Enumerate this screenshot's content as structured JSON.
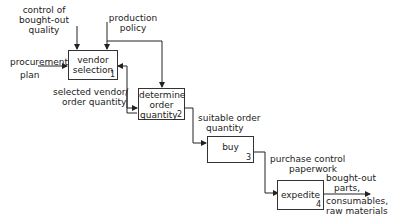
{
  "boxes": [
    {
      "id": 1,
      "label_lines": [
        "vendor",
        "selection"
      ],
      "number": "1"
    },
    {
      "id": 2,
      "label_lines": [
        "determine",
        "order",
        "quantity"
      ],
      "number": "2"
    },
    {
      "id": 3,
      "label_lines": [
        "buy"
      ],
      "number": "3"
    },
    {
      "id": 4,
      "label_lines": [
        "expedite"
      ],
      "number": "4"
    }
  ],
  "labels": {
    "control_quality": [
      "control of",
      "bought-out",
      "quality"
    ],
    "production_policy": [
      "production",
      "policy"
    ],
    "procurement_plan": [
      "procurement",
      "plan"
    ],
    "selected_vendor": [
      "selected vendor/",
      "order quantity"
    ],
    "suitable_order": [
      "suitable order",
      "quantity"
    ],
    "purchase_control": [
      "purchase control",
      "paperwork"
    ],
    "output": [
      "bought-out",
      "parts,",
      "consumables,",
      "raw materials"
    ]
  }
}
